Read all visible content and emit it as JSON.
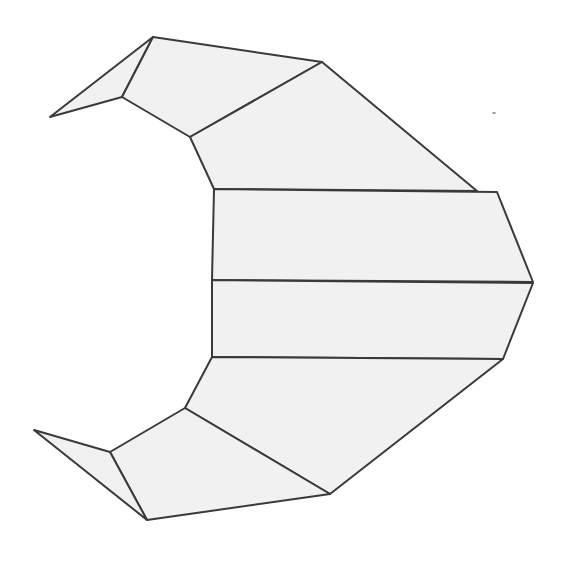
{
  "figure": {
    "type": "polygon-line-drawing",
    "width": 571,
    "height": 562,
    "background": "#ffffff",
    "fill": "#f1f1f1",
    "stroke": "#3a3a3a",
    "pieces": [
      {
        "name": "top-tip-triangle",
        "points": "50,117 153,37 122,97"
      },
      {
        "name": "top-quad",
        "points": "122,97 153,37 322,62 190,137"
      },
      {
        "name": "upper-trapezoid",
        "points": "190,137 322,62 477,191 214,189"
      },
      {
        "name": "upper-band",
        "points": "214,189 497,192 533,282 212,280"
      },
      {
        "name": "lower-band",
        "points": "212,280 533,283 503,359 212,357"
      },
      {
        "name": "lower-trapezoid",
        "points": "212,357 503,359 330,494 185,408"
      },
      {
        "name": "bottom-quad",
        "points": "185,408 330,494 147,520 110,452"
      },
      {
        "name": "bottom-tip-triangle",
        "points": "34,430 110,452 147,520"
      }
    ],
    "speck": {
      "cx": 494,
      "cy": 113
    }
  }
}
